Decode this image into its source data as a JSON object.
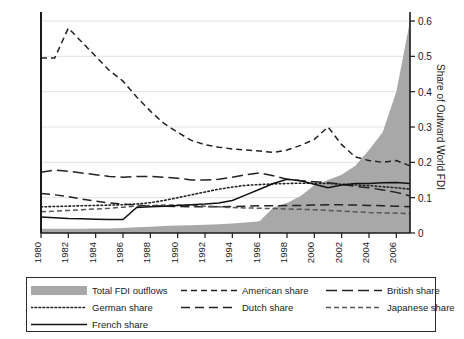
{
  "chart_data": {
    "type": "area",
    "title": "",
    "xlabel": "",
    "ylabel": "Share of Outward World FDI",
    "xlim": [
      1980,
      2007
    ],
    "ylim": [
      0,
      0.6
    ],
    "yticks": [
      0,
      0.1,
      0.2,
      0.3,
      0.4,
      0.5,
      0.6
    ],
    "ytick_labels": [
      "0",
      "0.1",
      "0.2",
      "0.3",
      "0.4",
      "0.5",
      "0.6"
    ],
    "xticks": [
      1980,
      1982,
      1984,
      1986,
      1988,
      1990,
      1992,
      1994,
      1996,
      1998,
      2000,
      2002,
      2004,
      2006
    ],
    "xtick_labels": [
      "1980",
      "1982",
      "1984",
      "1986",
      "1988",
      "1990",
      "1992",
      "1994",
      "1996",
      "1998",
      "2000",
      "2002",
      "2004",
      "2006"
    ],
    "grid": "horizontal",
    "legend_position": "below-plot",
    "x": [
      1980,
      1981,
      1982,
      1983,
      1984,
      1985,
      1986,
      1987,
      1988,
      1989,
      1990,
      1991,
      1992,
      1993,
      1994,
      1995,
      1996,
      1997,
      1998,
      1999,
      2000,
      2001,
      2002,
      2003,
      2004,
      2005,
      2006,
      2007
    ],
    "series": [
      {
        "name": "Total FDI outflows",
        "style": "area",
        "color": "#a8a8a8",
        "values": [
          0.012,
          0.012,
          0.012,
          0.012,
          0.013,
          0.013,
          0.014,
          0.016,
          0.018,
          0.02,
          0.021,
          0.022,
          0.023,
          0.025,
          0.027,
          0.03,
          0.033,
          0.072,
          0.085,
          0.105,
          0.135,
          0.15,
          0.165,
          0.19,
          0.235,
          0.285,
          0.4,
          0.6
        ]
      },
      {
        "name": "American share",
        "style": "dashed",
        "color": "#222222",
        "values": [
          0.495,
          0.495,
          0.58,
          0.54,
          0.5,
          0.46,
          0.43,
          0.385,
          0.345,
          0.31,
          0.285,
          0.262,
          0.25,
          0.243,
          0.238,
          0.235,
          0.232,
          0.228,
          0.235,
          0.248,
          0.265,
          0.3,
          0.25,
          0.215,
          0.205,
          0.2,
          0.205,
          0.19
        ]
      },
      {
        "name": "British share",
        "style": "longdash",
        "color": "#222222",
        "values": [
          0.172,
          0.178,
          0.175,
          0.17,
          0.165,
          0.16,
          0.158,
          0.16,
          0.16,
          0.158,
          0.155,
          0.15,
          0.15,
          0.152,
          0.158,
          0.165,
          0.17,
          0.162,
          0.152,
          0.148,
          0.145,
          0.142,
          0.138,
          0.132,
          0.128,
          0.122,
          0.115,
          0.105
        ]
      },
      {
        "name": "German share",
        "style": "dotted",
        "color": "#222222",
        "values": [
          0.074,
          0.075,
          0.076,
          0.077,
          0.078,
          0.079,
          0.08,
          0.082,
          0.086,
          0.092,
          0.1,
          0.108,
          0.116,
          0.124,
          0.13,
          0.135,
          0.137,
          0.139,
          0.14,
          0.141,
          0.141,
          0.14,
          0.138,
          0.136,
          0.134,
          0.131,
          0.128,
          0.124
        ]
      },
      {
        "name": "Dutch share",
        "style": "dashdash",
        "color": "#222222",
        "values": [
          0.112,
          0.108,
          0.103,
          0.096,
          0.09,
          0.085,
          0.082,
          0.079,
          0.077,
          0.076,
          0.075,
          0.074,
          0.074,
          0.074,
          0.075,
          0.076,
          0.077,
          0.077,
          0.078,
          0.078,
          0.079,
          0.08,
          0.08,
          0.079,
          0.078,
          0.077,
          0.076,
          0.074
        ]
      },
      {
        "name": "Japanese share",
        "style": "dashdot",
        "color": "#555555",
        "values": [
          0.06,
          0.062,
          0.064,
          0.066,
          0.068,
          0.07,
          0.073,
          0.076,
          0.078,
          0.079,
          0.079,
          0.078,
          0.076,
          0.074,
          0.072,
          0.071,
          0.07,
          0.069,
          0.068,
          0.067,
          0.066,
          0.064,
          0.062,
          0.06,
          0.058,
          0.057,
          0.056,
          0.055
        ]
      },
      {
        "name": "French share",
        "style": "solid",
        "color": "#111111",
        "values": [
          0.045,
          0.043,
          0.041,
          0.04,
          0.039,
          0.038,
          0.038,
          0.072,
          0.074,
          0.076,
          0.078,
          0.08,
          0.082,
          0.085,
          0.092,
          0.108,
          0.124,
          0.14,
          0.152,
          0.148,
          0.138,
          0.128,
          0.136,
          0.14,
          0.14,
          0.142,
          0.143,
          0.14
        ]
      }
    ]
  },
  "legend": {
    "items": [
      {
        "label": "Total FDI outflows",
        "symbol": "area-swatch"
      },
      {
        "label": "American share",
        "symbol": "dashed-line"
      },
      {
        "label": "British share",
        "symbol": "longdash-line"
      },
      {
        "label": "German share",
        "symbol": "dotted-line"
      },
      {
        "label": "Dutch share",
        "symbol": "dashdash-line"
      },
      {
        "label": "Japanese share",
        "symbol": "dashdot-line"
      },
      {
        "label": "French share",
        "symbol": "solid-line"
      }
    ]
  }
}
